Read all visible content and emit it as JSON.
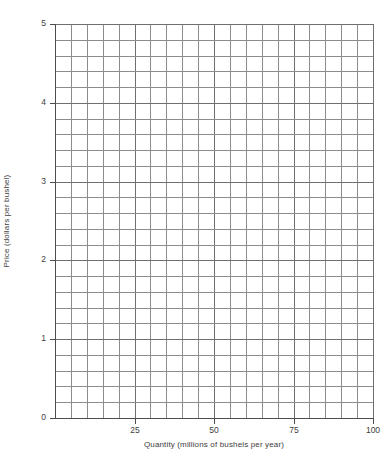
{
  "chart_data": {
    "type": "line",
    "title": "",
    "subtitle": "",
    "xlabel": "Quantity (millions of bushels per year)",
    "ylabel": "Price (dollars per bushel)",
    "xlim": [
      0,
      100
    ],
    "ylim": [
      0,
      5
    ],
    "x_major_ticks": [
      0,
      25,
      50,
      75,
      100
    ],
    "x_major_ticklabels": [
      "",
      "25",
      "50",
      "75",
      "100"
    ],
    "y_major_ticks": [
      0,
      1,
      2,
      3,
      4,
      5
    ],
    "y_major_ticklabels": [
      "0",
      "1",
      "2",
      "3",
      "4",
      "5"
    ],
    "x_minor_step": 5,
    "y_minor_step": 0.2,
    "grid": true,
    "grid_style": "graph-paper",
    "grid_color": "#8c8c8c",
    "axis_color": "#4d4d4d",
    "background": "#ffffff",
    "legend": null,
    "legend_position": "none",
    "annotations": [],
    "series": [],
    "note": "Blank graph grid; no data series plotted."
  },
  "axes": {
    "y_ticks": [
      {
        "label": "5",
        "value": 5
      },
      {
        "label": "4",
        "value": 4
      },
      {
        "label": "3",
        "value": 3
      },
      {
        "label": "2",
        "value": 2
      },
      {
        "label": "1",
        "value": 1
      },
      {
        "label": "0",
        "value": 0
      }
    ],
    "x_ticks": [
      {
        "label": "25",
        "value": 25
      },
      {
        "label": "50",
        "value": 50
      },
      {
        "label": "75",
        "value": 75
      },
      {
        "label": "100",
        "value": 100
      }
    ],
    "x_title": "Quantity (millions of bushels per year)",
    "y_title": "Price (dollars per bushel)"
  }
}
